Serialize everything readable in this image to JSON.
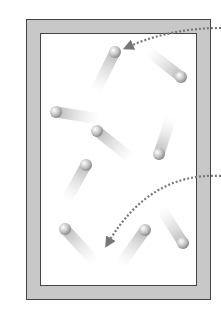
{
  "diagram": {
    "type": "gas-particles-in-container",
    "container": {
      "wall_color": "#c8c8c8",
      "border_color": "#444444",
      "interior_color": "#ffffff"
    },
    "particle_color": "#bdbdbd",
    "particles": [
      {
        "x": 115,
        "y": 52,
        "trail_dx": -20,
        "trail_dy": 40
      },
      {
        "x": 181,
        "y": 77,
        "trail_dx": -33,
        "trail_dy": -26
      },
      {
        "x": 56,
        "y": 112,
        "trail_dx": 44,
        "trail_dy": 7
      },
      {
        "x": 97,
        "y": 131,
        "trail_dx": 35,
        "trail_dy": 28
      },
      {
        "x": 159,
        "y": 154,
        "trail_dx": 12,
        "trail_dy": -37
      },
      {
        "x": 86,
        "y": 165,
        "trail_dx": -20,
        "trail_dy": 36
      },
      {
        "x": 65,
        "y": 229,
        "trail_dx": 30,
        "trail_dy": 33
      },
      {
        "x": 145,
        "y": 230,
        "trail_dx": -25,
        "trail_dy": 35
      },
      {
        "x": 183,
        "y": 243,
        "trail_dx": -22,
        "trail_dy": -35
      }
    ],
    "arrows": [
      {
        "name": "arrow-to-top-particle",
        "path": "M221,28 Q170,28 128,47",
        "tip": [
          127,
          47
        ]
      },
      {
        "name": "arrow-to-lower-particle",
        "path": "M221,176 Q150,172 108,243",
        "tip": [
          107,
          245
        ]
      }
    ],
    "arrow_color": "#777777"
  }
}
